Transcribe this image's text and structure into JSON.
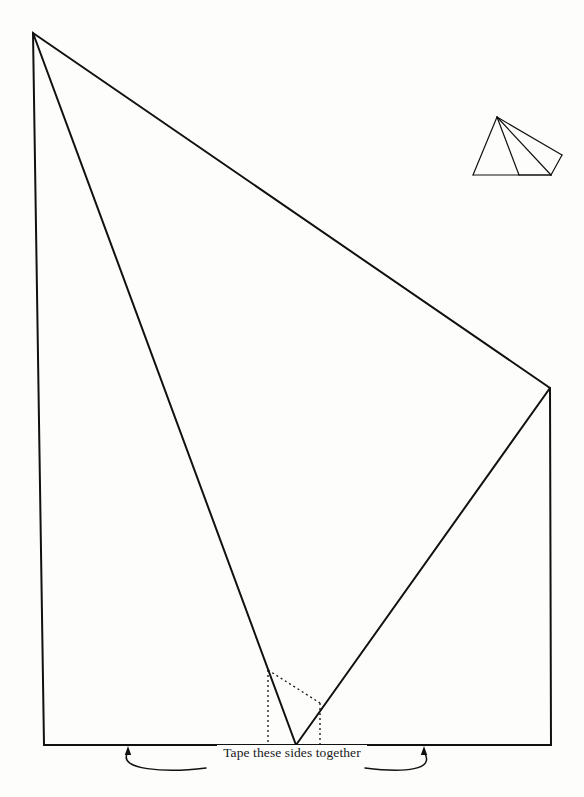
{
  "page": {
    "width": 584,
    "height": 797,
    "background_color": "#fdfdfc",
    "ink_color": "#111111"
  },
  "caption": {
    "text": "Tape these sides together",
    "font_style": "serif",
    "position": "bottom-center"
  },
  "net": {
    "name": "pyramid-net-outline",
    "description": "Large unfolded net of a square pyramid drawn as solid black outline",
    "stroke_color": "#111111",
    "stroke_width": 2,
    "outline_points": [
      {
        "x": 33,
        "y": 33
      },
      {
        "x": 550,
        "y": 388
      },
      {
        "x": 551,
        "y": 745
      },
      {
        "x": 44,
        "y": 745
      }
    ],
    "fold_lines": [
      {
        "name": "fold-left",
        "from": {
          "x": 33,
          "y": 33
        },
        "to": {
          "x": 296,
          "y": 745
        }
      },
      {
        "name": "fold-right",
        "from": {
          "x": 550,
          "y": 388
        },
        "to": {
          "x": 296,
          "y": 745
        }
      }
    ]
  },
  "tabs": {
    "name": "glue-tab-dotted-guides",
    "stroke_color": "#111111",
    "stroke_width": 1.3,
    "dash_pattern": "2 3",
    "segments": [
      {
        "name": "dotted-vertical-left",
        "from": {
          "x": 268,
          "y": 670
        },
        "to": {
          "x": 268,
          "y": 745
        }
      },
      {
        "name": "dotted-vertical-right",
        "from": {
          "x": 320,
          "y": 703
        },
        "to": {
          "x": 320,
          "y": 745
        }
      },
      {
        "name": "dotted-diagonal",
        "from": {
          "x": 268,
          "y": 670
        },
        "to": {
          "x": 320,
          "y": 703
        }
      }
    ]
  },
  "pointers": {
    "name": "curly-arrow-pointers",
    "stroke_color": "#111111",
    "left_arrow": {
      "tip": {
        "x": 128,
        "y": 746
      },
      "label": "left-tape-arrow"
    },
    "right_arrow": {
      "tip": {
        "x": 424,
        "y": 746
      },
      "label": "right-tape-arrow"
    },
    "left_leader": {
      "from": {
        "x": 206,
        "y": 768
      },
      "to": {
        "x": 128,
        "y": 752
      }
    },
    "right_leader": {
      "from": {
        "x": 365,
        "y": 768
      },
      "to": {
        "x": 424,
        "y": 752
      }
    }
  },
  "thumbnail": {
    "name": "assembled-pyramid-thumbnail",
    "description": "Small line drawing of the finished square pyramid in the upper right",
    "stroke_color": "#111111",
    "stroke_width": 1.2,
    "vertices": {
      "apex": {
        "x": 497,
        "y": 117
      },
      "front_left": {
        "x": 473,
        "y": 175
      },
      "front_right": {
        "x": 551,
        "y": 175
      },
      "back_right": {
        "x": 562,
        "y": 155
      },
      "back_left": {
        "x": 519,
        "y": 175
      }
    },
    "edges": [
      {
        "from": "apex",
        "to": "front_left"
      },
      {
        "from": "apex",
        "to": "back_right"
      },
      {
        "from": "apex",
        "to": "front_right"
      },
      {
        "from": "apex",
        "to": "back_left"
      },
      {
        "from": "front_left",
        "to": "front_right"
      },
      {
        "from": "front_right",
        "to": "back_right"
      },
      {
        "from": "back_left",
        "to": "front_right"
      }
    ]
  }
}
